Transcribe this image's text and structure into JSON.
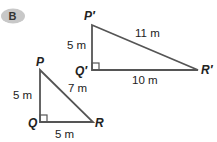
{
  "badge": {
    "label": "B",
    "color": "#c8c8c8"
  },
  "triangle_large": {
    "vertices": {
      "top": "P′",
      "right_angle": "Q′",
      "right": "R′"
    },
    "sides": {
      "vertical": "5 m",
      "horizontal": "10 m",
      "hypotenuse": "11 m"
    }
  },
  "triangle_small": {
    "vertices": {
      "top": "P",
      "right_angle": "Q",
      "right": "R"
    },
    "sides": {
      "vertical": "5 m",
      "horizontal": "5 m",
      "hypotenuse": "7 m"
    }
  },
  "colors": {
    "stroke": "#555555",
    "text": "#222222"
  }
}
